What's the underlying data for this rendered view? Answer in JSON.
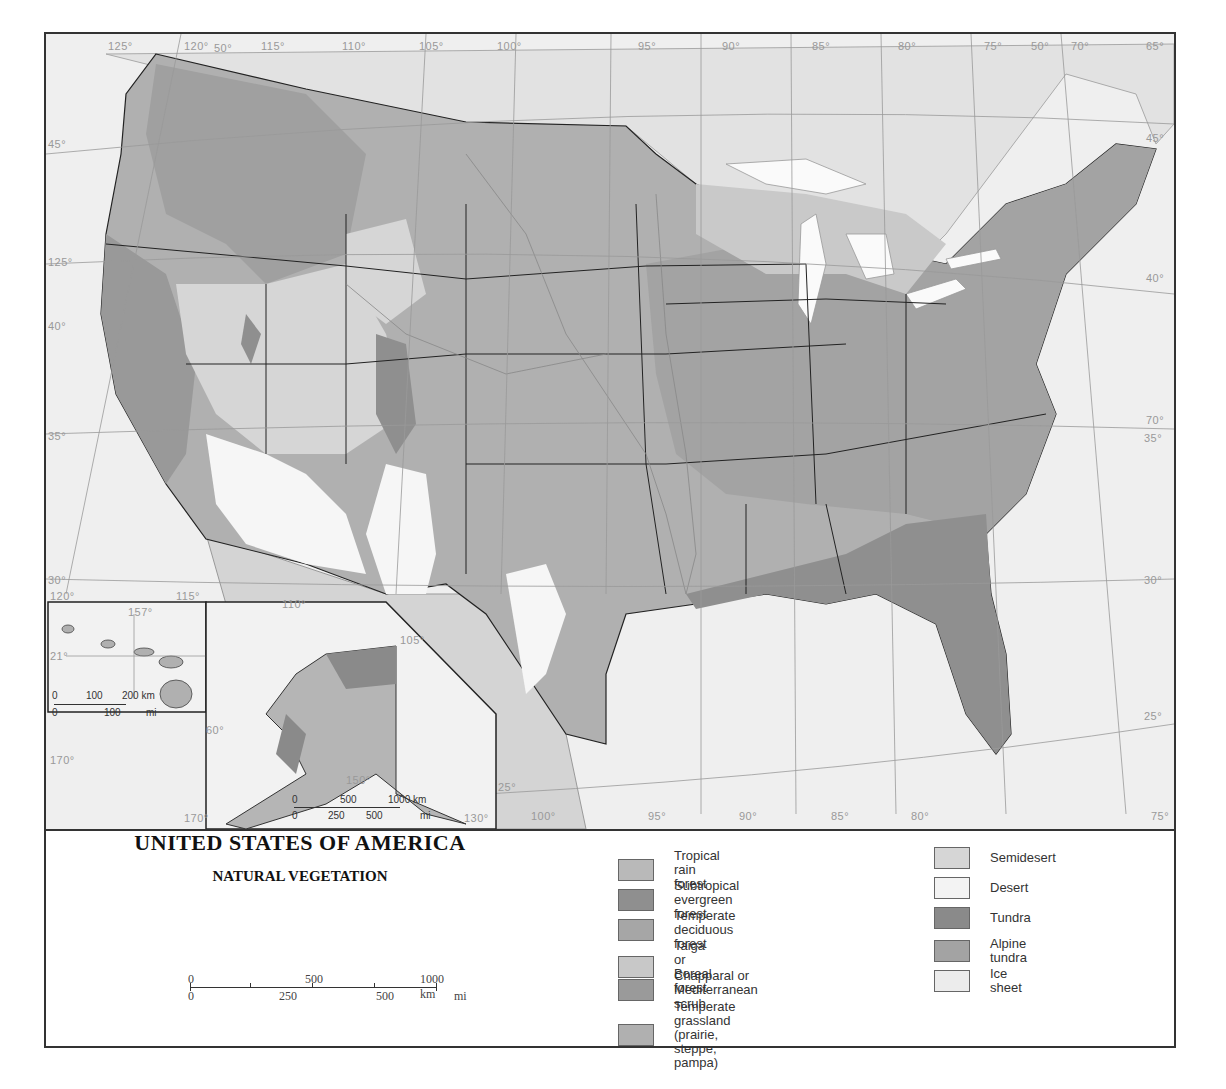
{
  "map": {
    "title": "UNITED STATES OF AMERICA",
    "subtitle": "NATURAL VEGETATION",
    "longitude_labels_top": [
      "125°",
      "120°",
      "115°",
      "110°",
      "105°",
      "100°",
      "95°",
      "90°",
      "85°",
      "80°",
      "75°",
      "70°",
      "65°"
    ],
    "longitude_labels_bottom": [
      "100°",
      "95°",
      "90°",
      "85°",
      "80°",
      "75°"
    ],
    "latitude_labels_left": [
      "45°",
      "40°",
      "35°",
      "30°"
    ],
    "latitude_labels_right": [
      "45°",
      "40°",
      "35°",
      "30°",
      "25°"
    ],
    "other_labels": {
      "lat50_top_left": "50°",
      "lat50_top_right": "50°",
      "lon125_left": "125°",
      "lon120_inset": "120°",
      "lon115_inset": "115°",
      "lon110_inset": "110°",
      "lon105_inset": "105°",
      "lat25_gulf": "25°",
      "lon70_right": "70°",
      "lon150_alaska": "150°",
      "lon170_alaska": "170°",
      "lat60_alaska": "60°",
      "lon130_alaska": "130°",
      "lon170_left": "170°"
    }
  },
  "hawaii_inset": {
    "lon_label": "157°",
    "lat_label": "21°",
    "scale": {
      "km_ticks": [
        "0",
        "100",
        "200 km"
      ],
      "mi_ticks": [
        "0",
        "100",
        "mi"
      ]
    }
  },
  "alaska_inset": {
    "scale": {
      "km_ticks": [
        "0",
        "500",
        "1000 km"
      ],
      "mi_ticks": [
        "0",
        "250",
        "500",
        "mi"
      ]
    }
  },
  "main_scale": {
    "km_ticks": [
      "0",
      "500",
      "1000 km"
    ],
    "mi_ticks": [
      "0",
      "250",
      "500",
      "mi"
    ]
  },
  "legend": {
    "items": [
      {
        "label": "Tropical rain forest",
        "color": "#b9b9b9"
      },
      {
        "label": "Subtropical evergreen forest",
        "color": "#8f8f8f"
      },
      {
        "label": "Temperate deciduous forest",
        "color": "#a6a6a6"
      },
      {
        "label": "Taiga or Boreal forest",
        "color": "#c8c8c8"
      },
      {
        "label": "Chapparal or\nMediterranean scrub",
        "color": "#9a9a9a"
      },
      {
        "label": "Temperate grassland\n(prairie, steppe, pampa)",
        "color": "#b0b0b0"
      },
      {
        "label": "Semidesert",
        "color": "#d6d6d6"
      },
      {
        "label": "Desert",
        "color": "#f3f3f3"
      },
      {
        "label": "Tundra",
        "color": "#8a8a8a"
      },
      {
        "label": "Alpine tundra",
        "color": "#a3a3a3"
      },
      {
        "label": "Ice sheet",
        "color": "#ececec"
      }
    ]
  }
}
